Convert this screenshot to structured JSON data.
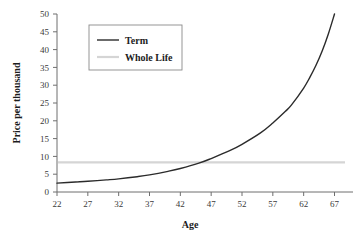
{
  "chart_data": {
    "type": "line",
    "title": "",
    "xlabel": "Age",
    "ylabel": "Price per thousand",
    "xlim": [
      22,
      70
    ],
    "ylim": [
      0,
      50
    ],
    "grid": false,
    "legend_position": "top-left",
    "xticks": [
      "22",
      "27",
      "32",
      "37",
      "42",
      "47",
      "52",
      "57",
      "62",
      "67"
    ],
    "xtick_values": [
      22,
      27,
      32,
      37,
      42,
      47,
      52,
      57,
      62,
      67
    ],
    "yticks": [
      "0",
      "5",
      "10",
      "15",
      "20",
      "25",
      "30",
      "35",
      "40",
      "45",
      "50"
    ],
    "ytick_values": [
      0,
      5,
      10,
      15,
      20,
      25,
      30,
      35,
      40,
      45,
      50
    ],
    "x": [
      22,
      25,
      27,
      30,
      32,
      35,
      37,
      40,
      42,
      45,
      47,
      50,
      52,
      55,
      57,
      59,
      60,
      62,
      63,
      64,
      65,
      66,
      67
    ],
    "series": [
      {
        "name": "Term",
        "color": "#2b2b2b",
        "values": [
          2.5,
          2.8,
          3.0,
          3.4,
          3.7,
          4.3,
          4.8,
          5.8,
          6.6,
          8.1,
          9.4,
          11.6,
          13.4,
          16.6,
          19.4,
          22.6,
          24.4,
          29.2,
          32.2,
          35.6,
          39.6,
          44.4,
          50.0
        ]
      },
      {
        "name": "Whole Life",
        "color": "#d5d5d5",
        "constant": 8.3,
        "values": [
          8.3,
          8.3,
          8.3,
          8.3,
          8.3,
          8.3,
          8.3,
          8.3,
          8.3,
          8.3,
          8.3,
          8.3,
          8.3,
          8.3,
          8.3,
          8.3,
          8.3,
          8.3,
          8.3,
          8.3,
          8.3,
          8.3,
          8.3
        ]
      }
    ],
    "annotations": []
  },
  "legend": {
    "entries": [
      {
        "label": "Term",
        "color": "#2b2b2b"
      },
      {
        "label": "Whole Life",
        "color": "#d5d5d5"
      }
    ]
  },
  "axes": {
    "x_title": "Age",
    "y_title": "Price per thousand"
  },
  "colors": {
    "background": "#ffffff",
    "axis": "#6e6e6e",
    "tick_text": "#3a3a3a",
    "term_line": "#2b2b2b",
    "whole_life_line": "#d5d5d5",
    "legend_border": "#8a8a8a"
  }
}
